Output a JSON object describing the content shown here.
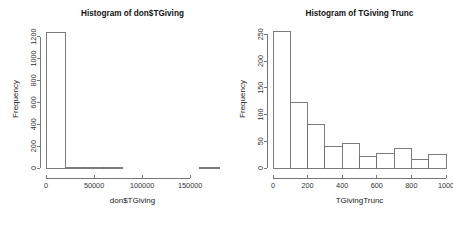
{
  "figure": {
    "background": "#ffffff",
    "foreground": "#333333",
    "bar_fill": "#ffffff",
    "bar_stroke": "#6e6e6e",
    "panels": 2
  },
  "chart_data": [
    {
      "type": "bar",
      "subtype": "histogram",
      "panel": "left",
      "title": "Histogram of don$TGiving",
      "xlabel": "don$TGiving",
      "ylabel": "Frequency",
      "xlim": [
        0,
        180000
      ],
      "ylim": [
        0,
        1260
      ],
      "xticks": [
        0,
        50000,
        100000,
        150000
      ],
      "xtick_labels": [
        "0",
        "50000",
        "100000",
        "150000"
      ],
      "yticks": [
        0,
        200,
        400,
        600,
        800,
        1000,
        1200
      ],
      "ytick_labels": [
        "0",
        "200",
        "400",
        "600",
        "800",
        "1000",
        "1200"
      ],
      "grid": false,
      "legend": false,
      "bin_width": 20000,
      "bin_edges": [
        0,
        20000,
        40000,
        60000,
        80000,
        100000,
        120000,
        140000,
        160000,
        180000
      ],
      "values": [
        1233,
        9,
        2,
        1,
        0,
        0,
        0,
        0,
        1
      ]
    },
    {
      "type": "bar",
      "subtype": "histogram",
      "panel": "right",
      "title": "Histogram of TGiving Trunc",
      "xlabel": "TGivingTrunc",
      "ylabel": "Frequency",
      "xlim": [
        0,
        1000
      ],
      "ylim": [
        0,
        258
      ],
      "xticks": [
        0,
        200,
        400,
        600,
        800,
        1000
      ],
      "xtick_labels": [
        "0",
        "200",
        "400",
        "600",
        "800",
        "1000"
      ],
      "yticks": [
        0,
        50,
        100,
        150,
        200,
        250
      ],
      "ytick_labels": [
        "0",
        "50",
        "100",
        "150",
        "200",
        "250"
      ],
      "grid": false,
      "legend": false,
      "bin_width": 100,
      "bin_edges": [
        0,
        100,
        200,
        300,
        400,
        500,
        600,
        700,
        800,
        900,
        1000
      ],
      "values": [
        255,
        123,
        81,
        41,
        46,
        21,
        28,
        37,
        16,
        25
      ]
    }
  ]
}
